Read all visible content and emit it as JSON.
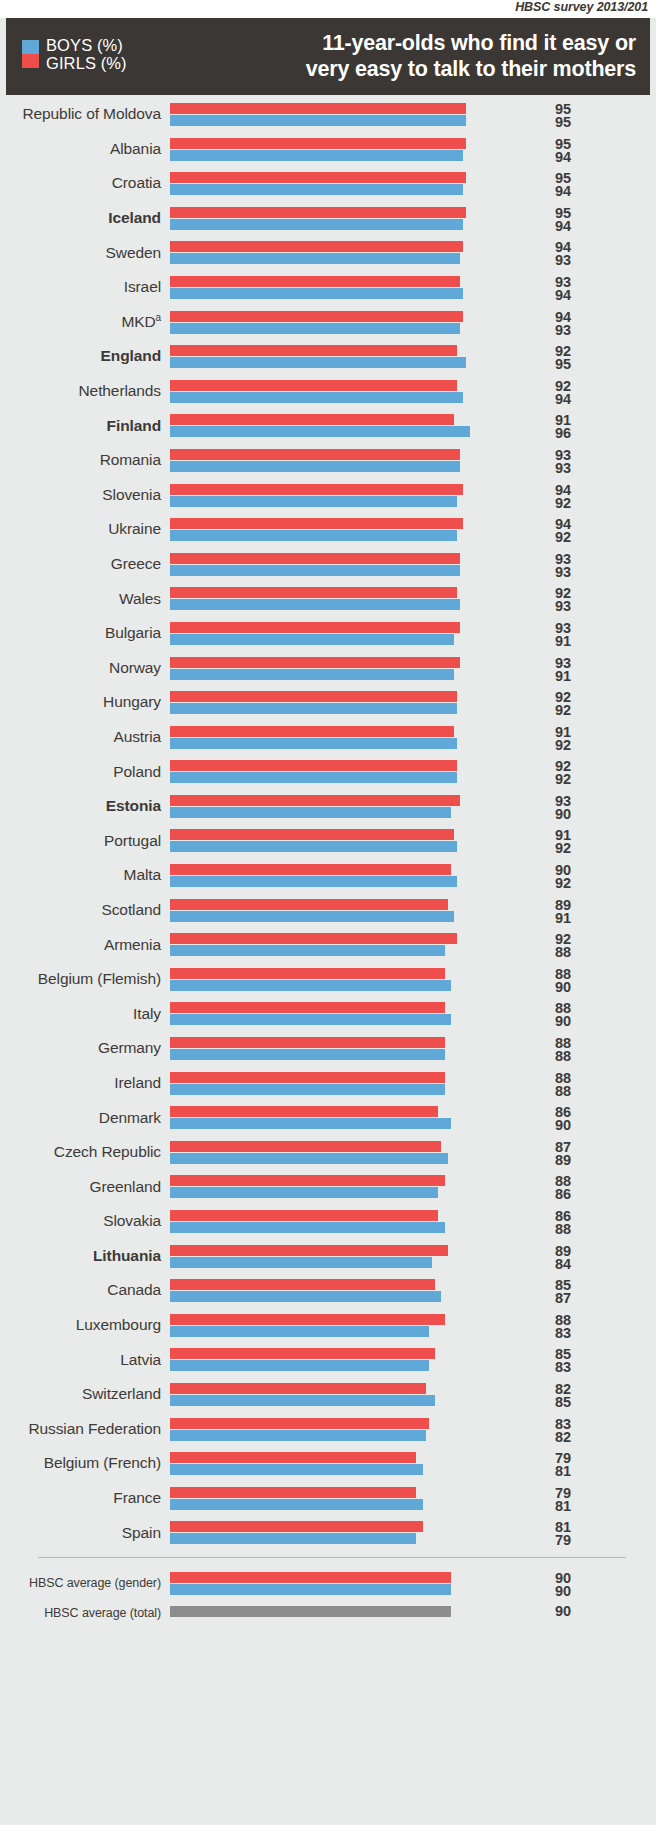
{
  "source": {
    "text": "HBSC survey 2013/201"
  },
  "header": {
    "title_line1": "11-year-olds who find it easy or",
    "title_line2": "very easy to talk to their mothers",
    "legend": {
      "boys_label": "BOYS (%)",
      "girls_label": "GIRLS (%)",
      "boys_color": "#5fa8d8",
      "girls_color": "#ef4f4c"
    }
  },
  "chart_data": {
    "type": "bar",
    "orientation": "horizontal",
    "title": "11-year-olds who find it easy or very easy to talk to their mothers",
    "xlabel": "",
    "ylabel": "",
    "xlim": [
      0,
      100
    ],
    "grid": false,
    "legend_position": "top-left",
    "value_order_per_row": [
      "girls",
      "boys"
    ],
    "categories": [
      "Republic of Moldova",
      "Albania",
      "Croatia",
      "Iceland",
      "Sweden",
      "Israel",
      "MKD",
      "England",
      "Netherlands",
      "Finland",
      "Romania",
      "Slovenia",
      "Ukraine",
      "Greece",
      "Wales",
      "Bulgaria",
      "Norway",
      "Hungary",
      "Austria",
      "Poland",
      "Estonia",
      "Portugal",
      "Malta",
      "Scotland",
      "Armenia",
      "Belgium (Flemish)",
      "Italy",
      "Germany",
      "Ireland",
      "Denmark",
      "Czech Republic",
      "Greenland",
      "Slovakia",
      "Lithuania",
      "Canada",
      "Luxembourg",
      "Latvia",
      "Switzerland",
      "Russian Federation",
      "Belgium (French)",
      "France",
      "Spain"
    ],
    "series": [
      {
        "name": "GIRLS (%)",
        "color": "#ef4f4c",
        "values": [
          95,
          95,
          95,
          95,
          94,
          93,
          94,
          92,
          92,
          91,
          93,
          94,
          94,
          93,
          92,
          93,
          93,
          92,
          91,
          92,
          93,
          91,
          90,
          89,
          92,
          88,
          88,
          88,
          88,
          86,
          87,
          88,
          86,
          89,
          85,
          88,
          85,
          82,
          83,
          79,
          79,
          81
        ]
      },
      {
        "name": "BOYS (%)",
        "color": "#5fa8d8",
        "values": [
          95,
          94,
          94,
          94,
          93,
          94,
          93,
          95,
          94,
          96,
          93,
          92,
          92,
          93,
          93,
          91,
          91,
          92,
          92,
          92,
          90,
          92,
          92,
          91,
          88,
          90,
          90,
          88,
          88,
          90,
          89,
          86,
          88,
          84,
          87,
          83,
          83,
          85,
          82,
          81,
          81,
          79
        ]
      }
    ],
    "bold_categories": [
      "Iceland",
      "England",
      "Finland",
      "Estonia",
      "Lithuania"
    ],
    "footnote_markers": {
      "MKD": "a"
    },
    "averages": [
      {
        "label": "HBSC average (gender)",
        "type": "gender",
        "girls": 90,
        "boys": 90
      },
      {
        "label": "HBSC average (total)",
        "type": "total",
        "value": 90,
        "color": "#8d8d8d"
      }
    ]
  }
}
